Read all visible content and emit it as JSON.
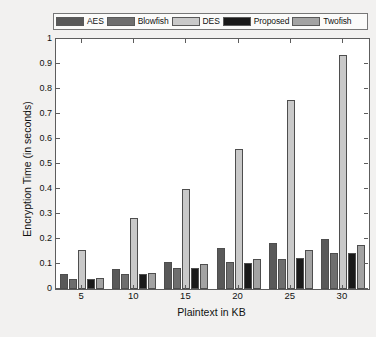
{
  "chart_data": {
    "type": "bar",
    "title": "",
    "subtitle": "",
    "xlabel": "Plaintext in KB",
    "ylabel": "Encryption Time (in seconds)",
    "categories": [
      "5",
      "10",
      "15",
      "20",
      "25",
      "30"
    ],
    "xtick_labels": [
      "5",
      "10",
      "15",
      "20",
      "25",
      "30"
    ],
    "ytick_labels": [
      "0",
      "0.1",
      "0.2",
      "0.3",
      "0.4",
      "0.5",
      "0.6",
      "0.7",
      "0.8",
      "0.9",
      "1"
    ],
    "ylim": [
      0,
      1
    ],
    "ytick_step": 0.1,
    "grid": false,
    "legend_position": "top-outside",
    "series": [
      {
        "name": "AES",
        "color": "#595959",
        "values": [
          0.06,
          0.08,
          0.11,
          0.165,
          0.185,
          0.2
        ]
      },
      {
        "name": "Blowfish",
        "color": "#6e6e6e",
        "values": [
          0.04,
          0.06,
          0.085,
          0.11,
          0.12,
          0.145
        ]
      },
      {
        "name": "DES",
        "color": "#c9c9c9",
        "values": [
          0.155,
          0.285,
          0.4,
          0.56,
          0.755,
          0.935
        ]
      },
      {
        "name": "Proposed",
        "color": "#1a1a1a",
        "values": [
          0.04,
          0.06,
          0.085,
          0.105,
          0.125,
          0.145
        ]
      },
      {
        "name": "Twofish",
        "color": "#a3a3a3",
        "values": [
          0.045,
          0.065,
          0.1,
          0.12,
          0.155,
          0.175
        ]
      }
    ]
  },
  "figure": {
    "background": "#f2f1f0",
    "axes_background": "#ffffff",
    "axes_line_color": "#5d5d5d",
    "bar_edge_color": "#4e4e4e"
  }
}
